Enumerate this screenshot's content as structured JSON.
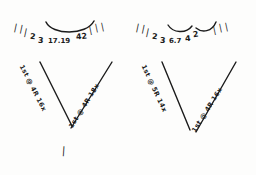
{
  "sketch": {
    "title": "hand-drawn dental arch notation",
    "ink_color": "#1b1b1b",
    "paper_color": "#fdfdfc"
  },
  "left_arch": {
    "name": "left-v-diagram",
    "tick_left_outer": "| |",
    "tick_left_inner": "|",
    "numbers": [
      "2",
      "3",
      "17.19",
      "42"
    ],
    "tick_right_inner": "|",
    "tick_right_outer": "| |",
    "label_left": "1st @ 4R 16x",
    "label_right": "1st @ 4R 18x"
  },
  "right_arch": {
    "name": "right-v-diagram",
    "tick_left_outer": "| |",
    "tick_left_inner": "|",
    "numbers": [
      "2",
      "3",
      "6.7",
      "4",
      "2"
    ],
    "tick_right_inner": "|",
    "tick_right_outer": "| |",
    "label_left": "1st @ 5R 14x",
    "label_right": "1st @ 4R 16x"
  },
  "footer": {
    "mark": "|"
  }
}
